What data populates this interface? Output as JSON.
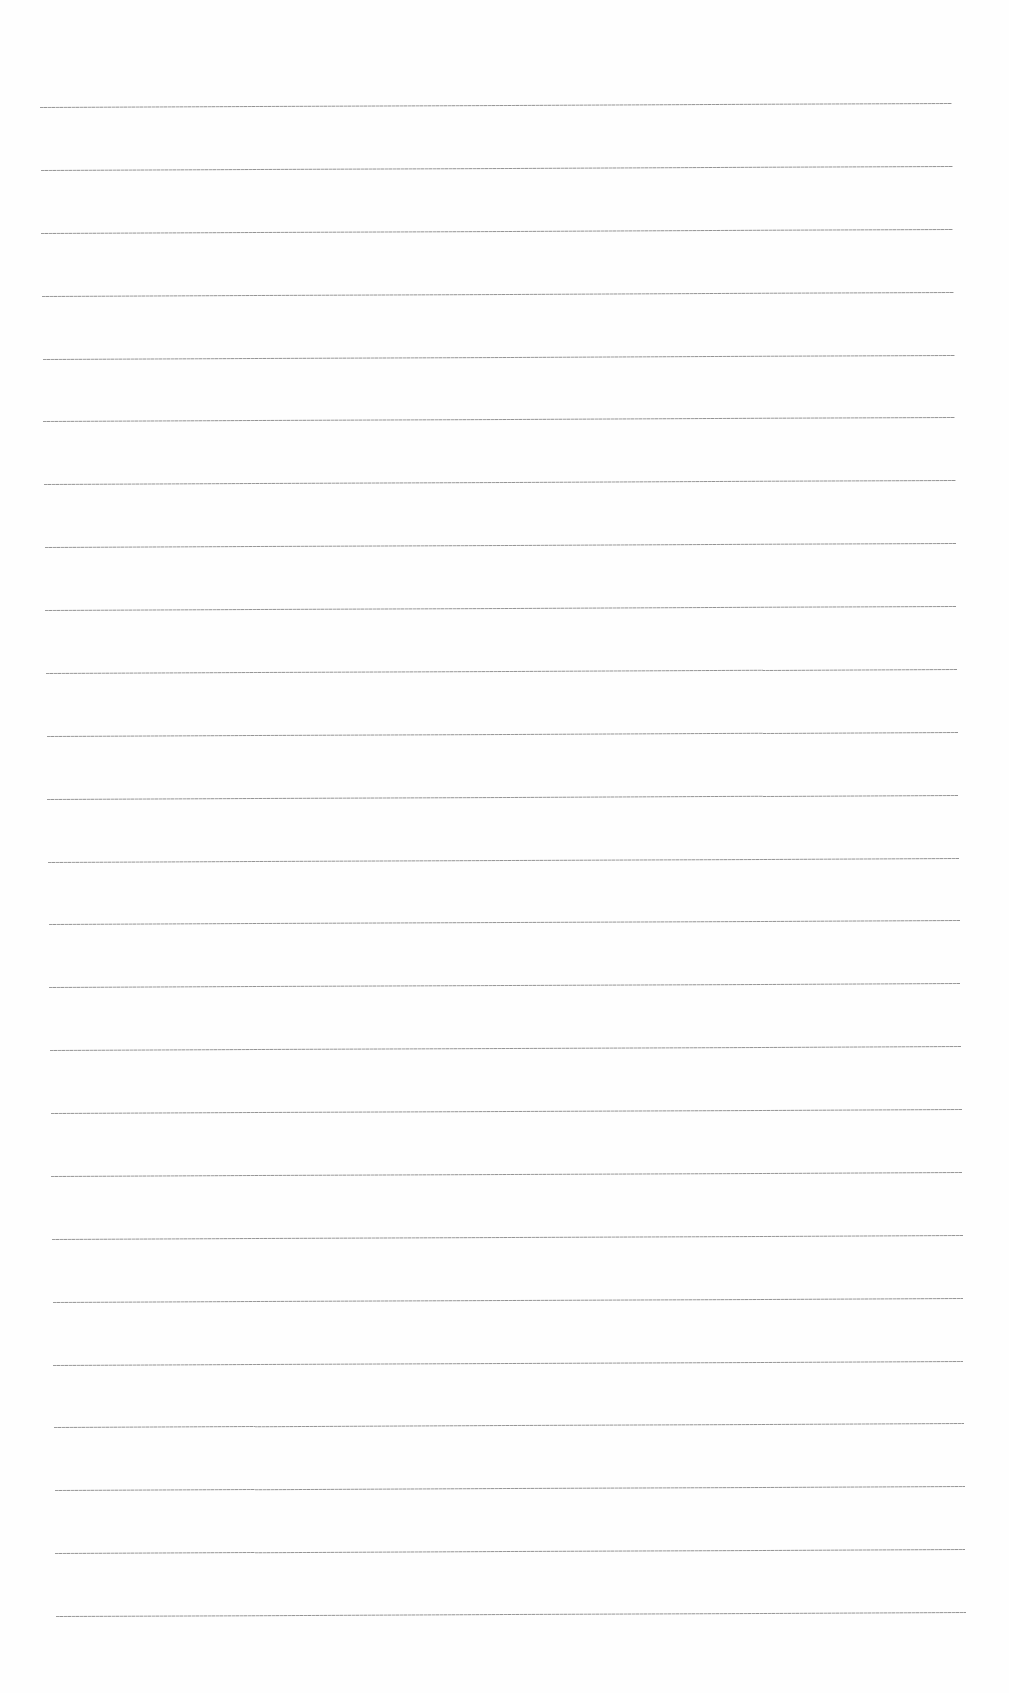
{
  "page": {
    "type": "blank lined paper",
    "background": "#fefefe",
    "line_color": "#8a8a8a",
    "line_count": 25,
    "first_line": {
      "x_start": 40,
      "x_end": 952,
      "y": 107
    },
    "last_line": {
      "x_start": 56,
      "x_end": 966,
      "y": 1616
    },
    "line_spacing": 62.9
  }
}
